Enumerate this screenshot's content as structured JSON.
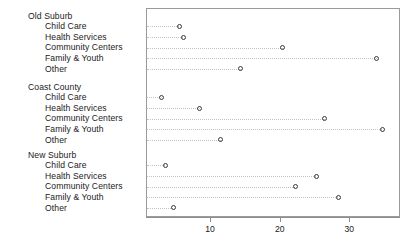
{
  "chart_data": {
    "type": "scatter",
    "title": "",
    "xlabel": "",
    "ylabel": "",
    "grid": false,
    "legend": "none",
    "xlim": [
      0.8,
      37.0
    ],
    "xticks": [
      10,
      20,
      30
    ],
    "xtick_labels": [
      "10",
      "20",
      "30"
    ],
    "categories": [
      "Child Care",
      "Health Services",
      "Community Centers",
      "Family & Youth",
      "Other"
    ],
    "groups": [
      {
        "name": "Old Suburb",
        "points": [
          {
            "category": "Child Care",
            "value": 5.4
          },
          {
            "category": "Health Services",
            "value": 6.0
          },
          {
            "category": "Community Centers",
            "value": 20.3
          },
          {
            "category": "Family & Youth",
            "value": 33.8
          },
          {
            "category": "Other",
            "value": 14.3
          }
        ]
      },
      {
        "name": "Coast County",
        "points": [
          {
            "category": "Child Care",
            "value": 2.9
          },
          {
            "category": "Health Services",
            "value": 8.4
          },
          {
            "category": "Community Centers",
            "value": 26.3
          },
          {
            "category": "Family & Youth",
            "value": 34.6
          },
          {
            "category": "Other",
            "value": 11.4
          }
        ]
      },
      {
        "name": "New Suburb",
        "points": [
          {
            "category": "Child Care",
            "value": 3.4
          },
          {
            "category": "Health Services",
            "value": 25.1
          },
          {
            "category": "Community Centers",
            "value": 22.1
          },
          {
            "category": "Family & Youth",
            "value": 28.3
          },
          {
            "category": "Other",
            "value": 4.6
          }
        ]
      }
    ],
    "marker": "open-circle",
    "marker_color": "#3a3a3a",
    "leader_line_color": "#c2c2c2",
    "panel_border_color": "#9a9a9a"
  }
}
